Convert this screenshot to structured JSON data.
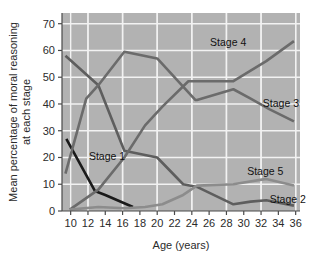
{
  "chart_data": {
    "type": "line",
    "title": "",
    "xlabel": "Age (years)",
    "ylabel": "Mean percentage of moral reasoning at each stage",
    "ylabel_line1": "Mean percentage of moral reasoning",
    "ylabel_line2": "at each stage",
    "xlim": [
      9,
      36.5
    ],
    "ylim": [
      0,
      74
    ],
    "grid": true,
    "grid_color": "#f2f2f2",
    "plot_background": "#b2b2b2",
    "legend_position": "inline-right",
    "xticks": [
      10,
      12,
      14,
      16,
      18,
      20,
      22,
      24,
      26,
      28,
      30,
      32,
      34,
      36
    ],
    "yticks": [
      0,
      10,
      20,
      30,
      40,
      50,
      60,
      70
    ],
    "series": [
      {
        "name": "Stage 1",
        "color": "#1a1a1a",
        "width": 2.6,
        "label_x": 14.2,
        "label_y": 20.5,
        "label_anchor": "middle",
        "x": [
          9.5,
          12.8,
          14.0,
          17.2
        ],
        "values": [
          27,
          7.5,
          6,
          1.5
        ]
      },
      {
        "name": "Stage 2",
        "color": "#5e5e5e",
        "width": 2.6,
        "label_x": 33.0,
        "label_y": 4.5,
        "label_anchor": "start",
        "x": [
          9.4,
          13.2,
          16.2,
          20.0,
          23.0,
          24.6,
          28.8,
          30.8,
          32.6,
          35.8
        ],
        "values": [
          58,
          47,
          22.5,
          20,
          10,
          9,
          2.5,
          3.5,
          4,
          2
        ]
      },
      {
        "name": "Stage 3",
        "color": "#6b6b6b",
        "width": 2.6,
        "label_x": 32.2,
        "label_y": 40.5,
        "label_anchor": "start",
        "x": [
          9.4,
          11.8,
          13.2,
          16.2,
          20.0,
          24.4,
          24.6,
          28.8,
          30.8,
          33.0,
          35.8
        ],
        "values": [
          14,
          42,
          47,
          59.5,
          57,
          41.5,
          41.5,
          45.5,
          42,
          38,
          33.5
        ]
      },
      {
        "name": "Stage 4",
        "color": "#6b6b6b",
        "width": 2.6,
        "label_x": 28.2,
        "label_y": 63.0,
        "label_anchor": "middle",
        "x": [
          9.9,
          13.2,
          16.2,
          18.6,
          20.6,
          23.6,
          24.6,
          28.8,
          32.6,
          35.8
        ],
        "values": [
          0.5,
          8,
          20,
          32,
          39,
          48.5,
          48.5,
          48.5,
          56,
          63.5
        ]
      },
      {
        "name": "Stage 5",
        "color": "#8c8c8c",
        "width": 2.6,
        "label_x": 30.4,
        "label_y": 15.0,
        "label_anchor": "start",
        "x": [
          9.9,
          13.2,
          16.2,
          18.6,
          20.6,
          23.0,
          24.6,
          28.8,
          32.6,
          35.8
        ],
        "values": [
          0.5,
          1.5,
          1,
          1.5,
          2.5,
          6,
          9.5,
          10,
          12,
          9.5
        ]
      }
    ]
  },
  "axis": {
    "x_title": "Age (years)",
    "y_title_line1": "Mean percentage of moral reasoning",
    "y_title_line2": "at each stage"
  }
}
